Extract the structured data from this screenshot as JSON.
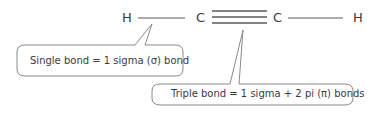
{
  "molecule": {
    "atoms": [
      "H",
      "C",
      "C",
      "H"
    ],
    "bonds": [
      "single",
      "triple",
      "single"
    ]
  },
  "callouts": [
    {
      "text": "Single bond = 1 sigma (σ) bond"
    },
    {
      "text": "Triple bond = 1 sigma + 2 pi (π) bonds"
    }
  ],
  "colors": {
    "line": "#5a5a5a",
    "text": "#3a3a3a",
    "callout_border": "#8a8a8a"
  }
}
